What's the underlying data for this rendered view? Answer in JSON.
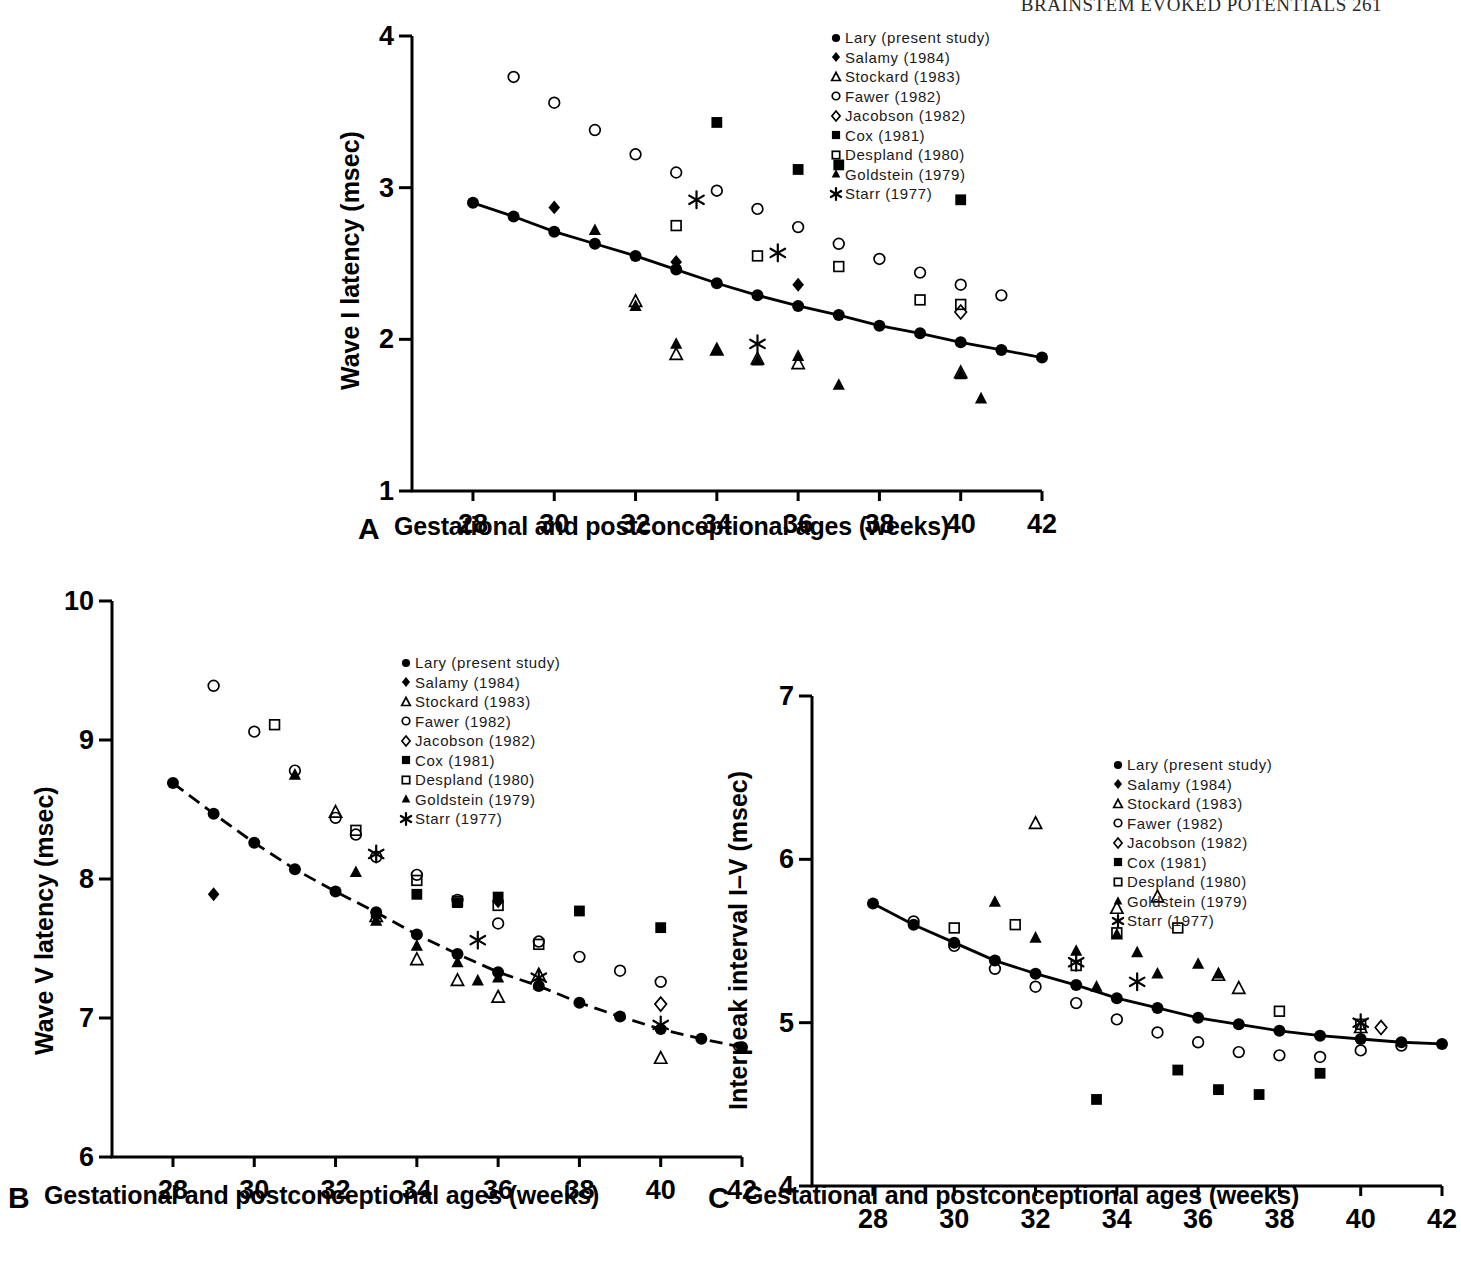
{
  "running_head": "BRAINSTEM EVOKED POTENTIALS    261",
  "shared": {
    "xlabel": "Gestational and postconceptional ages (weeks)",
    "xticks": [
      28,
      30,
      32,
      34,
      36,
      38,
      40,
      42
    ],
    "xlim": [
      26.5,
      42
    ],
    "legend": [
      {
        "marker": "filled-circle",
        "label": "Lary (present study)"
      },
      {
        "marker": "filled-diamond",
        "label": "Salamy (1984)"
      },
      {
        "marker": "open-triangle",
        "label": "Stockard (1983)"
      },
      {
        "marker": "open-circle",
        "label": "Fawer (1982)"
      },
      {
        "marker": "open-diamond",
        "label": "Jacobson (1982)"
      },
      {
        "marker": "filled-square",
        "label": "Cox (1981)"
      },
      {
        "marker": "open-square",
        "label": "Despland (1980)"
      },
      {
        "marker": "filled-triangle",
        "label": "Goldstein (1979)"
      },
      {
        "marker": "asterisk",
        "label": "Starr (1977)"
      }
    ]
  },
  "panels": [
    {
      "letter": "A",
      "ylabel": "Wave I latency (msec)"
    },
    {
      "letter": "B",
      "ylabel": "Wave V latency (msec)"
    },
    {
      "letter": "C",
      "ylabel": "Interpeak interval I–V (msec)"
    }
  ],
  "chart_data": [
    {
      "panel": "A",
      "type": "scatter",
      "title": "",
      "xlabel": "Gestational and postconceptional ages (weeks)",
      "ylabel": "Wave I latency (msec)",
      "xlim": [
        26.5,
        42
      ],
      "ylim": [
        1,
        4
      ],
      "xticks": [
        28,
        30,
        32,
        34,
        36,
        38,
        40,
        42
      ],
      "yticks": [
        1,
        2,
        3,
        4
      ],
      "grid": false,
      "legend_position": "top-right",
      "curve_style": "solid",
      "series": [
        {
          "name": "Lary (present study)",
          "marker": "filled-circle",
          "connected": true,
          "x": [
            28,
            29,
            30,
            31,
            32,
            33,
            34,
            35,
            36,
            37,
            38,
            39,
            40,
            41,
            42
          ],
          "y": [
            2.9,
            2.81,
            2.71,
            2.63,
            2.55,
            2.46,
            2.37,
            2.29,
            2.22,
            2.16,
            2.09,
            2.04,
            1.98,
            1.93,
            1.88
          ]
        },
        {
          "name": "Salamy (1984)",
          "marker": "filled-diamond",
          "connected": false,
          "x": [
            30,
            33,
            36
          ],
          "y": [
            2.87,
            2.51,
            2.36
          ]
        },
        {
          "name": "Stockard (1983)",
          "marker": "open-triangle",
          "connected": false,
          "x": [
            32,
            33,
            34,
            35,
            36,
            40
          ],
          "y": [
            2.25,
            1.9,
            1.93,
            1.87,
            1.84,
            1.78
          ]
        },
        {
          "name": "Fawer (1982)",
          "marker": "open-circle",
          "connected": false,
          "x": [
            29,
            30,
            31,
            32,
            33,
            34,
            35,
            36,
            37,
            38,
            39,
            40,
            41
          ],
          "y": [
            3.73,
            3.56,
            3.38,
            3.22,
            3.1,
            2.98,
            2.86,
            2.74,
            2.63,
            2.53,
            2.44,
            2.36,
            2.29
          ]
        },
        {
          "name": "Jacobson (1982)",
          "marker": "open-diamond",
          "connected": false,
          "x": [
            40
          ],
          "y": [
            2.18
          ]
        },
        {
          "name": "Cox (1981)",
          "marker": "filled-square",
          "connected": false,
          "x": [
            34,
            36,
            37,
            40
          ],
          "y": [
            3.43,
            3.12,
            3.15,
            2.92
          ]
        },
        {
          "name": "Despland (1980)",
          "marker": "open-square",
          "connected": false,
          "x": [
            33,
            35,
            37,
            39,
            40
          ],
          "y": [
            2.75,
            2.55,
            2.48,
            2.26,
            2.23
          ]
        },
        {
          "name": "Goldstein (1979)",
          "marker": "filled-triangle",
          "connected": false,
          "x": [
            31,
            32,
            33,
            34,
            35,
            36,
            37,
            40,
            40.5
          ],
          "y": [
            2.72,
            2.22,
            1.97,
            1.93,
            1.86,
            1.89,
            1.7,
            1.77,
            1.61
          ]
        },
        {
          "name": "Starr (1977)",
          "marker": "asterisk",
          "connected": false,
          "x": [
            33.5,
            35.5,
            35
          ],
          "y": [
            2.92,
            2.57,
            1.97
          ]
        }
      ]
    },
    {
      "panel": "B",
      "type": "scatter",
      "title": "",
      "xlabel": "Gestational and postconceptional ages (weeks)",
      "ylabel": "Wave V latency (msec)",
      "xlim": [
        26.5,
        42
      ],
      "ylim": [
        6,
        10
      ],
      "xticks": [
        28,
        30,
        32,
        34,
        36,
        38,
        40,
        42
      ],
      "yticks": [
        6,
        7,
        8,
        9,
        10
      ],
      "grid": false,
      "legend_position": "top-right",
      "curve_style": "dashed",
      "series": [
        {
          "name": "Lary (present study)",
          "marker": "filled-circle",
          "connected": true,
          "x": [
            28,
            29,
            30,
            31,
            32,
            33,
            34,
            35,
            36,
            37,
            38,
            39,
            40,
            41,
            42
          ],
          "y": [
            8.69,
            8.47,
            8.26,
            8.07,
            7.91,
            7.76,
            7.6,
            7.46,
            7.33,
            7.23,
            7.11,
            7.01,
            6.92,
            6.85,
            6.79
          ]
        },
        {
          "name": "Salamy (1984)",
          "marker": "filled-diamond",
          "connected": false,
          "x": [
            29,
            33,
            36
          ],
          "y": [
            7.89,
            7.73,
            7.84
          ]
        },
        {
          "name": "Stockard (1983)",
          "marker": "open-triangle",
          "connected": false,
          "x": [
            32,
            33,
            34,
            35,
            36,
            37,
            40
          ],
          "y": [
            8.48,
            7.73,
            7.42,
            7.27,
            7.15,
            7.31,
            6.71
          ]
        },
        {
          "name": "Fawer (1982)",
          "marker": "open-circle",
          "connected": false,
          "x": [
            29,
            30,
            31,
            32,
            32.5,
            33,
            34,
            35,
            36,
            37,
            38,
            39,
            40
          ],
          "y": [
            9.39,
            9.06,
            8.78,
            8.44,
            8.32,
            8.16,
            8.03,
            7.85,
            7.68,
            7.55,
            7.44,
            7.34,
            7.26
          ]
        },
        {
          "name": "Jacobson (1982)",
          "marker": "open-diamond",
          "connected": false,
          "x": [
            40
          ],
          "y": [
            7.1
          ]
        },
        {
          "name": "Cox (1981)",
          "marker": "filled-square",
          "connected": false,
          "x": [
            34,
            35,
            36,
            38,
            40
          ],
          "y": [
            7.89,
            7.83,
            7.87,
            7.77,
            7.65
          ]
        },
        {
          "name": "Despland (1980)",
          "marker": "open-square",
          "connected": false,
          "x": [
            30.5,
            32.5,
            34,
            35,
            36,
            37
          ],
          "y": [
            9.11,
            8.35,
            7.99,
            7.84,
            7.81,
            7.53
          ]
        },
        {
          "name": "Goldstein (1979)",
          "marker": "filled-triangle",
          "connected": false,
          "x": [
            31,
            32.5,
            33,
            34,
            35,
            35.5,
            36,
            37
          ],
          "y": [
            8.75,
            8.05,
            7.7,
            7.52,
            7.4,
            7.27,
            7.29,
            7.24
          ]
        },
        {
          "name": "Starr (1977)",
          "marker": "asterisk",
          "connected": false,
          "x": [
            33,
            35.5,
            37,
            40
          ],
          "y": [
            8.18,
            7.56,
            7.29,
            6.95
          ]
        }
      ]
    },
    {
      "panel": "C",
      "type": "scatter",
      "title": "",
      "xlabel": "Gestational and postconceptional ages (weeks)",
      "ylabel": "Interpeak interval I–V (msec)",
      "xlim": [
        26.5,
        42
      ],
      "ylim": [
        4,
        7
      ],
      "xticks": [
        28,
        30,
        32,
        34,
        36,
        38,
        40,
        42
      ],
      "yticks": [
        4,
        5,
        6,
        7
      ],
      "grid": false,
      "legend_position": "top-right",
      "curve_style": "solid",
      "series": [
        {
          "name": "Lary (present study)",
          "marker": "filled-circle",
          "connected": true,
          "x": [
            28,
            29,
            30,
            31,
            32,
            33,
            34,
            35,
            36,
            37,
            38,
            39,
            40,
            41,
            42
          ],
          "y": [
            5.73,
            5.6,
            5.49,
            5.38,
            5.3,
            5.23,
            5.15,
            5.09,
            5.03,
            4.99,
            4.95,
            4.92,
            4.9,
            4.88,
            4.87
          ]
        },
        {
          "name": "Salamy (1984)",
          "marker": "filled-diamond",
          "connected": false,
          "x": [],
          "y": []
        },
        {
          "name": "Stockard (1983)",
          "marker": "open-triangle",
          "connected": false,
          "x": [
            32,
            34,
            35,
            36.5,
            37,
            40
          ],
          "y": [
            6.22,
            5.7,
            5.77,
            5.29,
            5.21,
            4.97
          ]
        },
        {
          "name": "Fawer (1982)",
          "marker": "open-circle",
          "connected": false,
          "x": [
            29,
            30,
            31,
            32,
            33,
            34,
            35,
            36,
            37,
            38,
            39,
            40,
            41
          ],
          "y": [
            5.62,
            5.47,
            5.33,
            5.22,
            5.12,
            5.02,
            4.94,
            4.88,
            4.82,
            4.8,
            4.79,
            4.83,
            4.86
          ]
        },
        {
          "name": "Jacobson (1982)",
          "marker": "open-diamond",
          "connected": false,
          "x": [
            40.5
          ],
          "y": [
            4.97
          ]
        },
        {
          "name": "Cox (1981)",
          "marker": "filled-square",
          "connected": false,
          "x": [
            33.5,
            35.5,
            36.5,
            37.5,
            39
          ],
          "y": [
            4.53,
            4.71,
            4.59,
            4.56,
            4.69
          ]
        },
        {
          "name": "Despland (1980)",
          "marker": "open-square",
          "connected": false,
          "x": [
            30,
            31.5,
            33,
            34,
            35.5,
            38,
            40
          ],
          "y": [
            5.58,
            5.6,
            5.35,
            5.55,
            5.58,
            5.07,
            4.99
          ]
        },
        {
          "name": "Goldstein (1979)",
          "marker": "filled-triangle",
          "connected": false,
          "x": [
            31,
            32,
            33,
            33.5,
            34,
            34.5,
            35,
            36,
            36.5
          ],
          "y": [
            5.74,
            5.52,
            5.44,
            5.22,
            5.54,
            5.43,
            5.3,
            5.36,
            5.3
          ]
        },
        {
          "name": "Starr (1977)",
          "marker": "asterisk",
          "connected": false,
          "x": [
            33,
            34.5,
            40
          ],
          "y": [
            5.37,
            5.25,
            5.0
          ]
        }
      ]
    }
  ]
}
